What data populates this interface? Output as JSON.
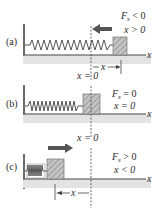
{
  "figure": {
    "colors": {
      "ink": "#2a2a2a",
      "floor_shadow": "#d9d9d9",
      "block_fill": "#bdbdbd",
      "arrow_fill": "#555555"
    },
    "panels": [
      {
        "id": "a",
        "label": "(a)",
        "force_label": "F",
        "force_sub": "s",
        "force_rel": " < 0",
        "x_rel": "x > 0",
        "axis_label": "x",
        "origin_label": "x = 0",
        "displacement_label": "x",
        "arrow_direction": "left"
      },
      {
        "id": "b",
        "label": "(b)",
        "force_label": "F",
        "force_sub": "s",
        "force_rel": " = 0",
        "x_rel": "x = 0",
        "axis_label": "x",
        "origin_label": "x = 0"
      },
      {
        "id": "c",
        "label": "(c)",
        "force_label": "F",
        "force_sub": "s",
        "force_rel": " > 0",
        "x_rel": "x < 0",
        "axis_label": "x",
        "origin_label": "x = 0",
        "displacement_label": "x",
        "arrow_direction": "right"
      }
    ]
  }
}
